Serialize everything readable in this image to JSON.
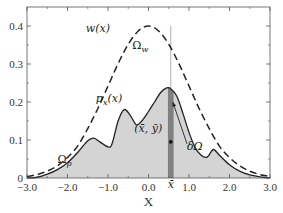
{
  "chart_data": {
    "type": "area",
    "title": "",
    "xlabel": "X",
    "ylabel": "",
    "xlim": [
      -3.0,
      3.0
    ],
    "ylim": [
      0,
      0.45
    ],
    "x_ticks": [
      -3.0,
      -2.0,
      -1.0,
      0.0,
      1.0,
      2.0,
      3.0
    ],
    "x_tick_labels": [
      "-3.0",
      "-2.0",
      "-1.0",
      "0.0",
      "1.0",
      "2.0",
      "3.0"
    ],
    "y_ticks": [
      0,
      0.1,
      0.2,
      0.3,
      0.4
    ],
    "y_tick_labels": [
      "0",
      "0.1",
      "0.2",
      "0.3",
      "0.4"
    ],
    "grid": false,
    "legend": "none",
    "series": [
      {
        "name": "w(x)",
        "style": "dashed",
        "color": "#222222",
        "x": [
          -3.0,
          -2.75,
          -2.5,
          -2.25,
          -2.0,
          -1.75,
          -1.5,
          -1.25,
          -1.0,
          -0.75,
          -0.5,
          -0.25,
          0.0,
          0.25,
          0.5,
          0.75,
          1.0,
          1.25,
          1.5,
          1.75,
          2.0,
          2.25,
          2.5,
          2.75,
          3.0
        ],
        "y": [
          0.004,
          0.009,
          0.018,
          0.032,
          0.054,
          0.084,
          0.13,
          0.183,
          0.242,
          0.301,
          0.352,
          0.387,
          0.4,
          0.387,
          0.352,
          0.301,
          0.242,
          0.183,
          0.13,
          0.084,
          0.054,
          0.032,
          0.018,
          0.009,
          0.004
        ]
      },
      {
        "name": "p_x(x)",
        "style": "solid-filled",
        "color": "#222222",
        "fill": "#d4d4d4",
        "x": [
          -3.0,
          -2.75,
          -2.5,
          -2.25,
          -2.0,
          -1.75,
          -1.5,
          -1.35,
          -1.2,
          -1.0,
          -0.9,
          -0.75,
          -0.6,
          -0.45,
          -0.3,
          -0.15,
          0.0,
          0.15,
          0.3,
          0.45,
          0.55,
          0.7,
          0.85,
          1.0,
          1.15,
          1.3,
          1.45,
          1.6,
          1.75,
          2.0,
          2.25,
          2.5,
          2.75,
          3.0
        ],
        "y": [
          0.0,
          0.002,
          0.01,
          0.022,
          0.04,
          0.067,
          0.098,
          0.105,
          0.095,
          0.082,
          0.09,
          0.15,
          0.18,
          0.165,
          0.14,
          0.152,
          0.175,
          0.2,
          0.225,
          0.237,
          0.235,
          0.215,
          0.17,
          0.12,
          0.08,
          0.06,
          0.055,
          0.075,
          0.06,
          0.035,
          0.018,
          0.008,
          0.003,
          0.0
        ]
      }
    ],
    "highlight_strip": {
      "x_center": 0.55,
      "half_width": 0.07,
      "color": "#808080"
    },
    "vertical_line": {
      "x": 0.55,
      "y_top": 0.4
    },
    "centroid_point": {
      "x": 0.55,
      "y": 0.095
    },
    "annotations": [
      {
        "text": "w(x)",
        "x": -1.55,
        "y": 0.385
      },
      {
        "text": "Ω_w",
        "x": -0.4,
        "y": 0.34
      },
      {
        "text": "p_x(x)",
        "x": -1.3,
        "y": 0.2
      },
      {
        "text": "(x̄, ȳ)",
        "x": -0.35,
        "y": 0.12
      },
      {
        "text": "δΩ",
        "x": 0.95,
        "y": 0.075
      },
      {
        "text": "Ω_p",
        "x": -2.25,
        "y": 0.04
      },
      {
        "text": "x̄",
        "x": 0.55,
        "y": -0.025
      }
    ],
    "arrow": {
      "from": [
        0.95,
        0.09
      ],
      "to": [
        0.6,
        0.2
      ]
    }
  },
  "labels": {
    "w": "w(x)",
    "omega_w": "Ωw",
    "px": "px(x)",
    "centroid": "(x̄, ȳ)",
    "delta_omega": "δΩ",
    "omega_p": "Ωp",
    "xbar": "x̄",
    "xlabel": "X"
  }
}
